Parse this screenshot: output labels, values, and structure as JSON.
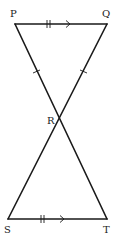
{
  "diagram": {
    "type": "geometry-figure",
    "points": {
      "P": {
        "label": "P",
        "x": 15,
        "y": 24
      },
      "Q": {
        "label": "Q",
        "x": 107,
        "y": 24
      },
      "R": {
        "label": "R",
        "x": 59,
        "y": 118
      },
      "S": {
        "label": "S",
        "x": 8,
        "y": 219
      },
      "T": {
        "label": "T",
        "x": 107,
        "y": 219
      }
    },
    "segments": [
      {
        "from": "P",
        "to": "Q",
        "marks": "double-tick, arrow"
      },
      {
        "from": "S",
        "to": "T",
        "marks": "double-tick, arrow"
      },
      {
        "from": "P",
        "to": "T",
        "marks": "single-tick on PR"
      },
      {
        "from": "Q",
        "to": "S",
        "marks": "single-tick on QR"
      }
    ],
    "stroke_color": "#1a1a1a"
  }
}
